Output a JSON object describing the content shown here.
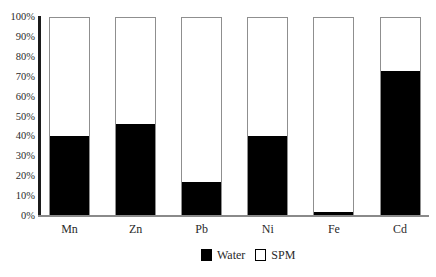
{
  "chart_data": {
    "type": "bar",
    "stacked_percent": true,
    "title": "",
    "xlabel": "",
    "ylabel": "",
    "categories": [
      "Mn",
      "Zn",
      "Pb",
      "Ni",
      "Fe",
      "Cd"
    ],
    "series": [
      {
        "name": "Water",
        "color": "#000000",
        "values": [
          40,
          46,
          17,
          40,
          1.5,
          73
        ]
      },
      {
        "name": "SPM",
        "color": "#ffffff",
        "values": [
          60,
          54,
          83,
          60,
          98.5,
          27
        ]
      }
    ],
    "ylim": [
      0,
      100
    ],
    "y_tick_labels": [
      "0%",
      "10%",
      "20%",
      "30%",
      "40%",
      "50%",
      "60%",
      "70%",
      "80%",
      "90%",
      "100%"
    ],
    "grid": false,
    "legend_position": "bottom-center"
  },
  "legend": {
    "items": [
      {
        "label": "Water",
        "fill": "#000000",
        "border": "#000000"
      },
      {
        "label": "SPM",
        "fill": "#ffffff",
        "border": "#000000"
      }
    ]
  },
  "colors": {
    "background": "#ffffff",
    "bar_border": "#8f8f8f",
    "axis_line": "#1b1b1b",
    "baseline": "#8a8a8a",
    "text": "#2a2a2a",
    "water_fill": "#000000",
    "spm_fill": "#ffffff"
  }
}
